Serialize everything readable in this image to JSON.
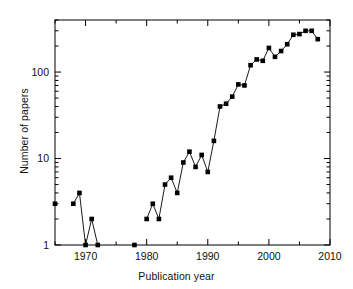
{
  "chart_data": {
    "type": "line",
    "title": "",
    "subtitle": "",
    "xlabel": "Publication year",
    "ylabel": "Number of papers",
    "xlim": [
      1965,
      2010
    ],
    "ylim": [
      1,
      400
    ],
    "yscale": "log",
    "xscale": "linear",
    "grid": false,
    "legend": null,
    "marker": "filled-square",
    "line_color": "#000000",
    "marker_color": "#000000",
    "xticks": [
      1970,
      1980,
      1990,
      2000,
      2010
    ],
    "xticklabels": [
      "1970",
      "1980",
      "1990",
      "2000",
      "2010"
    ],
    "yticks": [
      1,
      10,
      100
    ],
    "yticklabels": [
      "1",
      "10",
      "100"
    ],
    "y_minor_ticks": [
      2,
      3,
      4,
      5,
      6,
      7,
      8,
      9,
      20,
      30,
      40,
      50,
      60,
      70,
      80,
      90,
      200,
      300,
      400
    ],
    "x_minor_ticks": [
      1965,
      1975,
      1985,
      1995,
      2005
    ],
    "x": [
      1965,
      1968,
      1969,
      1970,
      1971,
      1972,
      1978,
      1980,
      1981,
      1982,
      1983,
      1984,
      1985,
      1986,
      1987,
      1988,
      1989,
      1990,
      1991,
      1992,
      1993,
      1994,
      1995,
      1996,
      1997,
      1998,
      1999,
      2000,
      2001,
      2002,
      2003,
      2004,
      2005,
      2006,
      2007,
      2008
    ],
    "values": [
      3,
      3,
      4,
      1,
      2,
      1,
      1,
      2,
      3,
      2,
      5,
      6,
      4,
      9,
      12,
      8,
      11,
      7,
      16,
      40,
      43,
      52,
      72,
      70,
      120,
      140,
      135,
      190,
      150,
      175,
      210,
      270,
      275,
      300,
      300,
      240
    ],
    "segments": [
      {
        "x": [
          1965
        ],
        "values": [
          3
        ]
      },
      {
        "x": [
          1968,
          1969,
          1970,
          1971,
          1972
        ],
        "values": [
          3,
          4,
          1,
          2,
          1
        ]
      },
      {
        "x": [
          1978
        ],
        "values": [
          1
        ]
      },
      {
        "x": [
          1980,
          1981,
          1982,
          1983,
          1984,
          1985,
          1986,
          1987,
          1988,
          1989,
          1990,
          1991,
          1992,
          1993,
          1994,
          1995,
          1996,
          1997,
          1998,
          1999,
          2000,
          2001,
          2002,
          2003,
          2004,
          2005,
          2006,
          2007,
          2008
        ],
        "values": [
          2,
          3,
          2,
          5,
          6,
          4,
          9,
          12,
          8,
          11,
          7,
          16,
          40,
          43,
          52,
          72,
          70,
          120,
          140,
          135,
          190,
          150,
          175,
          210,
          270,
          275,
          300,
          300,
          240
        ]
      }
    ],
    "annotations": []
  },
  "axes": {
    "frame_color": "#000000",
    "background": "#ffffff"
  }
}
